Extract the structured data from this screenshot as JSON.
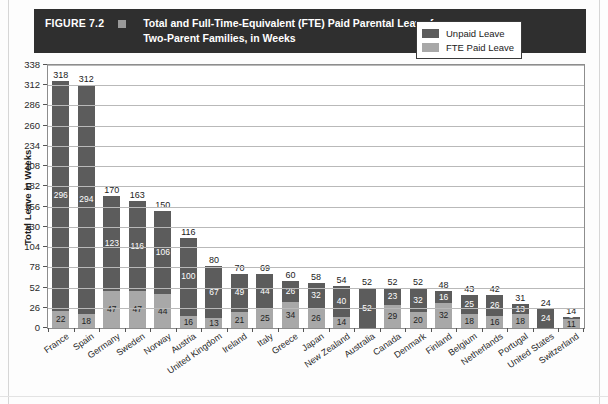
{
  "figure": {
    "number": "FIGURE 7.2",
    "title": "Total and Full-Time-Equivalent (FTE) Paid Parental Leave for Two-Parent Families, in Weeks",
    "title_line1": "Total and Full-Time-Equivalent (FTE) Paid Parental Leave for",
    "title_line2": "Two-Parent Families, in Weeks",
    "banner_color": "#2f2f2f",
    "marker_color": "#9a9a9a"
  },
  "legend": {
    "position": "top-right",
    "items": [
      {
        "label": "Unpaid Leave",
        "color": "#5c5c5c"
      },
      {
        "label": "FTE Paid Leave",
        "color": "#a8a8a8"
      }
    ]
  },
  "chart_data": {
    "type": "bar",
    "subtype": "stacked",
    "title": "Total and Full-Time-Equivalent (FTE) Paid Parental Leave for Two-Parent Families, in Weeks",
    "xlabel": "",
    "ylabel": "Total Leave in Weeks",
    "ylim": [
      0,
      338
    ],
    "ytick_step": 26,
    "yticks": [
      0,
      26,
      52,
      78,
      104,
      130,
      156,
      182,
      208,
      234,
      260,
      286,
      312,
      338
    ],
    "grid": true,
    "legend_position": "top-right",
    "categories": [
      "France",
      "Spain",
      "Germany",
      "Sweden",
      "Norway",
      "Austria",
      "United Kingdom",
      "Ireland",
      "Italy",
      "Greece",
      "Japan",
      "New Zealand",
      "Australia",
      "Canada",
      "Denmark",
      "Finland",
      "Belgium",
      "Netherlands",
      "Portugal",
      "United States",
      "Switzerland"
    ],
    "series": [
      {
        "name": "Unpaid Leave",
        "color": "#5c5c5c",
        "values": [
          296,
          294,
          123,
          116,
          106,
          100,
          67,
          49,
          44,
          26,
          32,
          40,
          52,
          23,
          32,
          16,
          25,
          26,
          13,
          24,
          3
        ]
      },
      {
        "name": "FTE Paid Leave",
        "color": "#a8a8a8",
        "values": [
          22,
          18,
          47,
          47,
          44,
          16,
          13,
          21,
          25,
          34,
          26,
          14,
          0,
          29,
          20,
          32,
          18,
          16,
          18,
          0,
          11
        ]
      }
    ],
    "totals": [
      318,
      312,
      170,
      163,
      150,
      116,
      80,
      70,
      69,
      60,
      58,
      54,
      52,
      52,
      52,
      48,
      43,
      42,
      31,
      24,
      14
    ]
  }
}
